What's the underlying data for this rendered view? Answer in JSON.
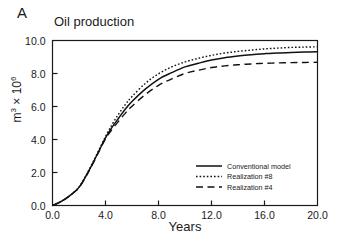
{
  "panel": {
    "label": "A"
  },
  "chart_data": {
    "type": "line",
    "title": "Oil production",
    "xlabel": "Years",
    "ylabel": "m3 x 106",
    "ylabel_base": "m",
    "ylabel_exp": "3",
    "ylabel_mult": " × 10",
    "ylabel_mult_exp": "6",
    "xlim": [
      0.0,
      20.0
    ],
    "ylim": [
      0.0,
      10.0
    ],
    "xticks": [
      "0.0",
      "4.0",
      "8.0",
      "12.0",
      "16.0",
      "20.0"
    ],
    "yticks": [
      "0.0",
      "2.0",
      "4.0",
      "6.0",
      "8.0",
      "10.0"
    ],
    "xtick_values": [
      0,
      4,
      8,
      12,
      16,
      20
    ],
    "ytick_values": [
      0,
      2,
      4,
      6,
      8,
      10
    ],
    "grid": false,
    "legend_position": "lower-right",
    "x": [
      0.0,
      0.5,
      1.0,
      1.5,
      2.0,
      2.5,
      3.0,
      3.5,
      4.0,
      4.5,
      5.0,
      5.5,
      6.0,
      7.0,
      8.0,
      9.0,
      10.0,
      11.0,
      12.0,
      13.0,
      14.0,
      15.0,
      16.0,
      17.0,
      18.0,
      19.0,
      20.0
    ],
    "series": [
      {
        "name": "Conventional model",
        "style": "solid",
        "color": "#111111",
        "values": [
          0.0,
          0.18,
          0.42,
          0.72,
          1.1,
          1.75,
          2.5,
          3.3,
          4.1,
          4.75,
          5.3,
          5.85,
          6.3,
          7.05,
          7.65,
          8.05,
          8.4,
          8.62,
          8.82,
          8.96,
          9.06,
          9.14,
          9.2,
          9.25,
          9.28,
          9.3,
          9.32
        ]
      },
      {
        "name": "Realization #8",
        "style": "dotted",
        "color": "#111111",
        "values": [
          0.0,
          0.18,
          0.42,
          0.72,
          1.12,
          1.78,
          2.54,
          3.36,
          4.18,
          4.92,
          5.55,
          6.12,
          6.6,
          7.4,
          7.98,
          8.4,
          8.7,
          8.92,
          9.1,
          9.24,
          9.34,
          9.42,
          9.49,
          9.54,
          9.58,
          9.6,
          9.62
        ]
      },
      {
        "name": "Realization #4",
        "style": "dashed",
        "color": "#111111",
        "values": [
          0.0,
          0.18,
          0.42,
          0.72,
          1.08,
          1.72,
          2.46,
          3.26,
          4.04,
          4.62,
          5.12,
          5.6,
          6.02,
          6.72,
          7.28,
          7.68,
          8.0,
          8.2,
          8.36,
          8.46,
          8.53,
          8.58,
          8.62,
          8.64,
          8.66,
          8.67,
          8.68
        ]
      }
    ]
  },
  "legend": {
    "entries": [
      {
        "label": "Conventional model",
        "style": "solid"
      },
      {
        "label": "Realization #8",
        "style": "dotted"
      },
      {
        "label": "Realization #4",
        "style": "dashed"
      }
    ]
  }
}
